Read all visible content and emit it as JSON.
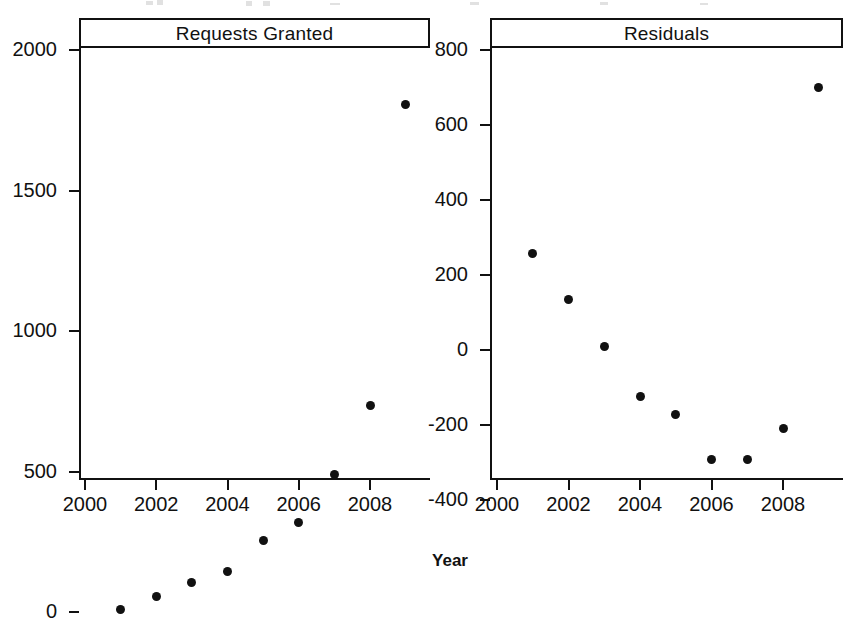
{
  "figure": {
    "width": 860,
    "height": 585,
    "background": "#ffffff",
    "foreground": "#111111",
    "point_color": "#111111",
    "xlabel": "Year"
  },
  "chart_data": [
    {
      "type": "scatter",
      "title": "Requests Granted",
      "xlabel": "Year",
      "ylabel": "",
      "xlim": [
        1999.3,
        2009.8
      ],
      "ylim": [
        -130,
        2085
      ],
      "grid": false,
      "legend": null,
      "xticks": [
        2000,
        2002,
        2004,
        2006,
        2008
      ],
      "xtick_labels": [
        "2000",
        "2002",
        "2004",
        "2006",
        "2008"
      ],
      "yticks": [
        0,
        500,
        1000,
        1500,
        2000
      ],
      "ytick_labels": [
        "0",
        "500",
        "1000",
        "1500",
        "2000"
      ],
      "x": [
        2001,
        2002,
        2003,
        2004,
        2005,
        2006,
        2007,
        2008,
        2009
      ],
      "values": [
        10,
        58,
        108,
        145,
        255,
        320,
        490,
        735,
        1805
      ]
    },
    {
      "type": "scatter",
      "title": "Residuals",
      "xlabel": "Year",
      "ylabel": "",
      "xlim": [
        1999.3,
        2009.8
      ],
      "ylim": [
        -420,
        830
      ],
      "grid": false,
      "legend": null,
      "xticks": [
        2000,
        2002,
        2004,
        2006,
        2008
      ],
      "xtick_labels": [
        "2000",
        "2002",
        "2004",
        "2006",
        "2008"
      ],
      "yticks": [
        -400,
        -200,
        0,
        200,
        400,
        600,
        800
      ],
      "ytick_labels": [
        "-400",
        "-200",
        "0",
        "200",
        "400",
        "600",
        "800"
      ],
      "x": [
        2001,
        2002,
        2003,
        2004,
        2005,
        2006,
        2007,
        2008,
        2009
      ],
      "values": [
        258,
        135,
        10,
        -125,
        -172,
        -292,
        -292,
        -208,
        700
      ]
    }
  ]
}
